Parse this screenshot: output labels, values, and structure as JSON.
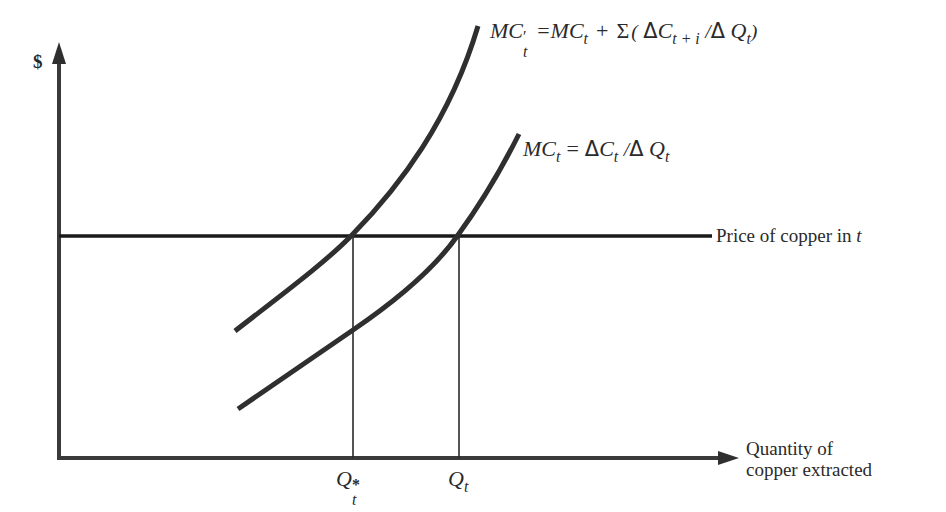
{
  "figure": {
    "type": "economics-diagram"
  },
  "axes": {
    "y_label": "$",
    "x_label_line1": "Quantity of",
    "x_label_line2": "copper extracted"
  },
  "curves": {
    "mc_prime": {
      "label_lhs": "MC",
      "label_lhs_sup": "′",
      "label_lhs_sub": "t",
      "label_eq": "=",
      "label_rhs_mc": "MC",
      "label_rhs_mc_sub": "t",
      "label_plus": "+",
      "label_sigma": "Σ",
      "label_open": "(",
      "label_delta1": "Δ",
      "label_c": "C",
      "label_c_sub": "t + i",
      "label_slash": "/",
      "label_delta2": "Δ",
      "label_q": "Q",
      "label_q_sub": "t",
      "label_close": ")",
      "color": "#2f2f2f"
    },
    "mc": {
      "label_lhs": "MC",
      "label_lhs_sub": "t",
      "label_eq": "=",
      "label_delta1": "Δ",
      "label_c": "C",
      "label_c_sub": "t",
      "label_slash": "/",
      "label_delta2": "Δ",
      "label_q": "Q",
      "label_q_sub": "t",
      "color": "#2f2f2f"
    },
    "price": {
      "label_text": "Price of copper in ",
      "label_var": "t",
      "color": "#1a1a1a"
    }
  },
  "markers": {
    "q_star": {
      "main": "Q",
      "sup": "*",
      "sub": "t"
    },
    "q_t": {
      "main": "Q",
      "sub": "t"
    }
  },
  "colors": {
    "background": "#ffffff",
    "ink": "#2a2a2a",
    "axis": "#3a3a3a"
  }
}
